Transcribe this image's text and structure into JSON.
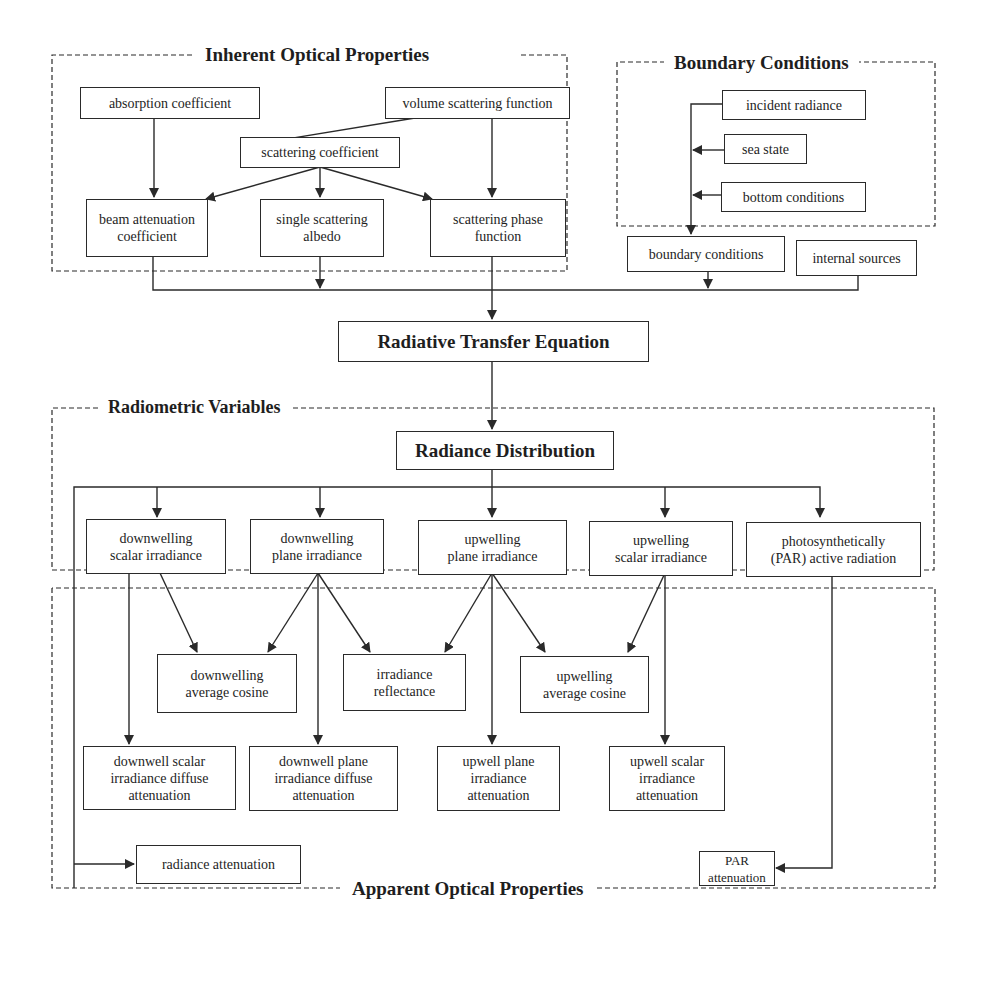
{
  "regions": {
    "iop": {
      "title": "Inherent Optical Properties"
    },
    "boundary": {
      "title": "Boundary Conditions"
    },
    "radiometric": {
      "title": "Radiometric Variables"
    },
    "aop": {
      "title": "Apparent Optical Properties"
    }
  },
  "nodes": {
    "absorption_coefficient": "absorption coefficient",
    "volume_scattering_function": "volume scattering function",
    "scattering_coefficient": "scattering coefficient",
    "beam_attenuation_coefficient": "beam attenuation\ncoefficient",
    "single_scattering_albedo": "single scattering\nalbedo",
    "scattering_phase_function": "scattering phase\nfunction",
    "incident_radiance": "incident radiance",
    "sea_state": "sea state",
    "bottom_conditions": "bottom conditions",
    "boundary_conditions": "boundary conditions",
    "internal_sources": "internal sources",
    "radiative_transfer_equation": "Radiative Transfer Equation",
    "radiance_distribution": "Radiance Distribution",
    "downwelling_scalar_irradiance": "downwelling\nscalar irradiance",
    "downwelling_plane_irradiance": "downwelling\nplane irradiance",
    "upwelling_plane_irradiance": "upwelling\nplane irradiance",
    "upwelling_scalar_irradiance": "upwelling\nscalar irradiance",
    "par": "photosynthetically\n(PAR) active radiation",
    "downwelling_average_cosine": "downwelling\naverage cosine",
    "irradiance_reflectance": "irradiance\nreflectance",
    "upwelling_average_cosine": "upwelling\naverage cosine",
    "downwell_scalar_irradiance_diffuse_attenuation": "downwell scalar\nirradiance diffuse\nattenuation",
    "downwell_plane_irradiance_diffuse_attenuation": "downwell plane\nirradiance diffuse\nattenuation",
    "upwell_plane_irradiance_attenuation": "upwell plane\nirradiance\nattenuation",
    "upwell_scalar_irradiance_attenuation": "upwell scalar\nirradiance\nattenuation",
    "radiance_attenuation": "radiance  attenuation",
    "par_attenuation": "PAR attenuation"
  },
  "colors": {
    "line": "#2a2a2a",
    "background": "#ffffff",
    "text": "#1e1e1e"
  }
}
